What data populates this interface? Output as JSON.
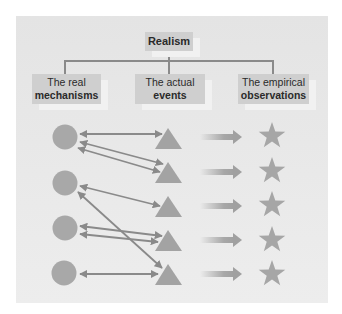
{
  "diagram": {
    "type": "hierarchy-with-relations",
    "root": {
      "label": "Realism"
    },
    "levels": [
      {
        "line1": "The real",
        "line2": "mechanisms",
        "shape": "circle"
      },
      {
        "line1": "The actual",
        "line2": "events",
        "shape": "triangle"
      },
      {
        "line1": "The empirical",
        "line2": "observations",
        "shape": "star"
      }
    ],
    "colors": {
      "panel": "#e6e6e6",
      "box": "#cfcfcf",
      "connector": "#8a8a8a",
      "shape": "#a8a8a8",
      "arrow": "#8f8f8f"
    },
    "mechanisms_count": 4,
    "events_count": 5,
    "observations_count": 5,
    "links_mechanism_to_event": [
      {
        "from": 1,
        "to": 1
      },
      {
        "from": 1,
        "to": 2
      },
      {
        "from": 1,
        "to": 2
      },
      {
        "from": 2,
        "to": 3
      },
      {
        "from": 2,
        "to": 5
      },
      {
        "from": 3,
        "to": 4
      },
      {
        "from": 3,
        "to": 4
      },
      {
        "from": 4,
        "to": 5
      }
    ],
    "links_event_to_observation": [
      {
        "from": 1,
        "to": 1
      },
      {
        "from": 2,
        "to": 2
      },
      {
        "from": 3,
        "to": 3
      },
      {
        "from": 4,
        "to": 4
      },
      {
        "from": 5,
        "to": 5
      }
    ]
  }
}
